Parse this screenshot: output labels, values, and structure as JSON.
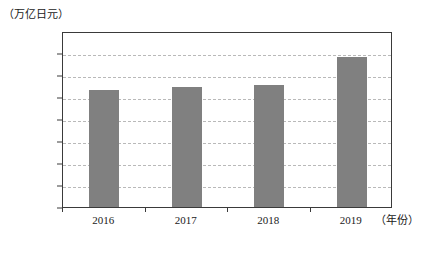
{
  "chart_data": {
    "type": "bar",
    "title": "",
    "subtitle": "",
    "xlabel": "（年份）",
    "ylabel": "（万亿日元）",
    "categories": [
      "2016",
      "2017",
      "2018",
      "2019"
    ],
    "values": [
      1060,
      1090,
      1105,
      1360
    ],
    "series": [
      {
        "name": "日元",
        "values": [
          1060,
          1090,
          1105,
          1360
        ]
      }
    ],
    "ylim": [
      0,
      1600
    ],
    "ytick_step": 200,
    "ytick_labels": [
      "0",
      "200",
      "400",
      "600",
      "800",
      "1 000",
      "1 200",
      "1 400",
      "1 600"
    ],
    "ytick_values": [
      0,
      200,
      400,
      600,
      800,
      1000,
      1200,
      1400,
      1600
    ],
    "xtick_labels": [
      "2016",
      "2017",
      "2018",
      "2019"
    ],
    "grid": true,
    "grid_axis": "y",
    "grid_style": "dashed",
    "legend": false,
    "legend_position": "none",
    "bar_color": "#808080",
    "axis_color": "#3a3a3a",
    "grid_color": "#b9b9b9",
    "background_color": "#ffffff"
  }
}
